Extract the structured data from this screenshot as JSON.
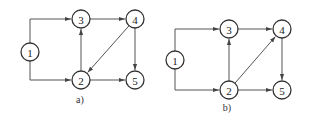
{
  "diagrams": [
    {
      "id": "a",
      "caption": "a)",
      "caption_pos": [
        80,
        103
      ],
      "nodes": [
        {
          "id": "1",
          "label": "1",
          "x": 30,
          "y": 52
        },
        {
          "id": "3",
          "label": "3",
          "x": 81,
          "y": 19
        },
        {
          "id": "4",
          "label": "4",
          "x": 135,
          "y": 19
        },
        {
          "id": "2",
          "label": "2",
          "x": 81,
          "y": 80
        },
        {
          "id": "5",
          "label": "5",
          "x": 135,
          "y": 80
        }
      ],
      "edges": [
        {
          "from": "1",
          "to": "3",
          "route": "elbow"
        },
        {
          "from": "1",
          "to": "2",
          "route": "elbow"
        },
        {
          "from": "3",
          "to": "4",
          "route": "straight"
        },
        {
          "from": "2",
          "to": "3",
          "route": "straight"
        },
        {
          "from": "4",
          "to": "2",
          "route": "straight"
        },
        {
          "from": "4",
          "to": "5",
          "route": "straight"
        },
        {
          "from": "2",
          "to": "5",
          "route": "straight"
        }
      ]
    },
    {
      "id": "b",
      "caption": "b)",
      "caption_pos": [
        227,
        111
      ],
      "nodes": [
        {
          "id": "1",
          "label": "1",
          "x": 175,
          "y": 60
        },
        {
          "id": "3",
          "label": "3",
          "x": 229,
          "y": 29
        },
        {
          "id": "4",
          "label": "4",
          "x": 282,
          "y": 29
        },
        {
          "id": "2",
          "label": "2",
          "x": 229,
          "y": 90
        },
        {
          "id": "5",
          "label": "5",
          "x": 282,
          "y": 90
        }
      ],
      "edges": [
        {
          "from": "1",
          "to": "3",
          "route": "elbow"
        },
        {
          "from": "1",
          "to": "2",
          "route": "elbow"
        },
        {
          "from": "3",
          "to": "4",
          "route": "straight"
        },
        {
          "from": "2",
          "to": "3",
          "route": "straight"
        },
        {
          "from": "2",
          "to": "4",
          "route": "straight"
        },
        {
          "from": "4",
          "to": "5",
          "route": "straight"
        },
        {
          "from": "2",
          "to": "5",
          "route": "straight"
        }
      ]
    }
  ],
  "style": {
    "node_radius": 9,
    "stroke_color": "#333333",
    "edge_color": "#555555"
  }
}
